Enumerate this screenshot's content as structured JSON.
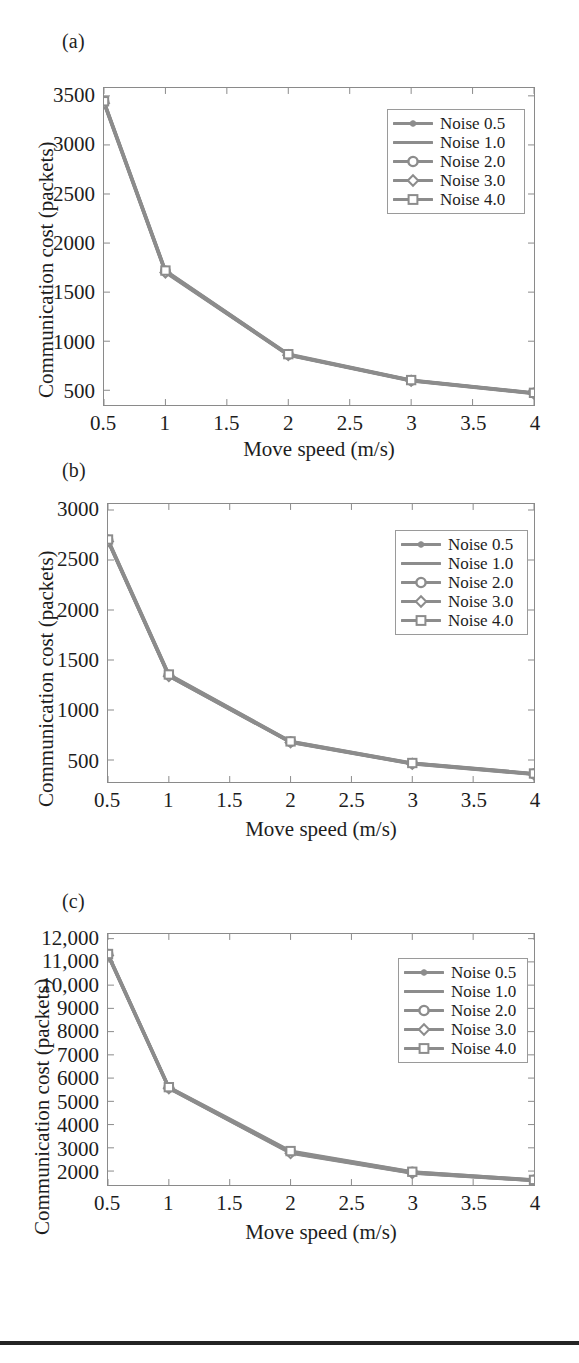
{
  "figure": {
    "background": "#ffffff",
    "line_color": "#8c8c8c",
    "frame_color": "#8a8a8a",
    "text_color": "#1d1d1d",
    "bottom_rule_color": "#242424"
  },
  "common": {
    "xlabel": "Move speed (m/s)",
    "ylabel": "Communication cost (packets)",
    "xticks": [
      "0.5",
      "1",
      "1.5",
      "2",
      "2.5",
      "3",
      "3.5",
      "4"
    ],
    "legend_labels": [
      "Noise 0.5",
      "Noise 1.0",
      "Noise 2.0",
      "Noise 3.0",
      "Noise 4.0"
    ],
    "legend_markers": [
      "dot",
      "none",
      "circle",
      "diamond",
      "square"
    ]
  },
  "panels": [
    {
      "label": "(a)",
      "yticks": [
        "500",
        "1000",
        "1500",
        "2000",
        "2500",
        "3000",
        "3500"
      ]
    },
    {
      "label": "(b)",
      "yticks": [
        "500",
        "1000",
        "1500",
        "2000",
        "2500",
        "3000"
      ]
    },
    {
      "label": "(c)",
      "yticks": [
        "2000",
        "3000",
        "4000",
        "5000",
        "6000",
        "7000",
        "8000",
        "9000",
        "10,000",
        "11,000",
        "12,000"
      ]
    }
  ],
  "chart_data": [
    {
      "type": "line",
      "panel": "(a)",
      "title": "(a)",
      "xlabel": "Move speed (m/s)",
      "ylabel": "Communication cost (packets)",
      "x": [
        0.5,
        1,
        2,
        3,
        4
      ],
      "xlim": [
        0.5,
        4
      ],
      "ylim": [
        350,
        3580
      ],
      "xticks": [
        0.5,
        1,
        1.5,
        2,
        2.5,
        3,
        3.5,
        4
      ],
      "yticks": [
        500,
        1000,
        1500,
        2000,
        2500,
        3000,
        3500
      ],
      "grid": false,
      "legend_position": "upper right",
      "series": [
        {
          "name": "Noise 0.5",
          "marker": "dot",
          "values": [
            3430,
            1710,
            860,
            600,
            470
          ]
        },
        {
          "name": "Noise 1.0",
          "marker": "none",
          "values": [
            3435,
            1705,
            862,
            598,
            468
          ]
        },
        {
          "name": "Noise 2.0",
          "marker": "circle",
          "values": [
            3440,
            1715,
            865,
            602,
            472
          ]
        },
        {
          "name": "Noise 3.0",
          "marker": "diamond",
          "values": [
            3425,
            1700,
            858,
            596,
            466
          ]
        },
        {
          "name": "Noise 4.0",
          "marker": "square",
          "values": [
            3445,
            1720,
            868,
            604,
            474
          ]
        }
      ]
    },
    {
      "type": "line",
      "panel": "(b)",
      "title": "(b)",
      "xlabel": "Move speed (m/s)",
      "ylabel": "Communication cost (packets)",
      "x": [
        0.5,
        1,
        2,
        3,
        4
      ],
      "xlim": [
        0.5,
        4
      ],
      "ylim": [
        280,
        3060
      ],
      "xticks": [
        0.5,
        1,
        1.5,
        2,
        2.5,
        3,
        3.5,
        4
      ],
      "yticks": [
        500,
        1000,
        1500,
        2000,
        2500,
        3000
      ],
      "grid": false,
      "legend_position": "upper right",
      "series": [
        {
          "name": "Noise 0.5",
          "marker": "dot",
          "values": [
            2690,
            1345,
            680,
            465,
            360
          ]
        },
        {
          "name": "Noise 1.0",
          "marker": "none",
          "values": [
            2695,
            1340,
            678,
            463,
            358
          ]
        },
        {
          "name": "Noise 2.0",
          "marker": "circle",
          "values": [
            2700,
            1350,
            684,
            468,
            362
          ]
        },
        {
          "name": "Noise 3.0",
          "marker": "diamond",
          "values": [
            2685,
            1338,
            676,
            461,
            356
          ]
        },
        {
          "name": "Noise 4.0",
          "marker": "square",
          "values": [
            2705,
            1355,
            686,
            470,
            365
          ]
        }
      ]
    },
    {
      "type": "line",
      "panel": "(c)",
      "title": "(c)",
      "xlabel": "Move speed (m/s)",
      "ylabel": "Communication cost (packets)",
      "x": [
        0.5,
        1,
        2,
        3,
        4
      ],
      "xlim": [
        0.5,
        4
      ],
      "ylim": [
        1400,
        12200
      ],
      "xticks": [
        0.5,
        1,
        1.5,
        2,
        2.5,
        3,
        3.5,
        4
      ],
      "yticks": [
        2000,
        3000,
        4000,
        5000,
        6000,
        7000,
        8000,
        9000,
        10000,
        11000,
        12000
      ],
      "grid": false,
      "legend_position": "upper right",
      "series": [
        {
          "name": "Noise 0.5",
          "marker": "dot",
          "values": [
            11300,
            5580,
            2800,
            1930,
            1600
          ]
        },
        {
          "name": "Noise 1.0",
          "marker": "none",
          "values": [
            11310,
            5570,
            2790,
            1920,
            1595
          ]
        },
        {
          "name": "Noise 2.0",
          "marker": "circle",
          "values": [
            11330,
            5600,
            2830,
            1960,
            1615
          ]
        },
        {
          "name": "Noise 3.0",
          "marker": "diamond",
          "values": [
            11280,
            5560,
            2770,
            1910,
            1590
          ]
        },
        {
          "name": "Noise 4.0",
          "marker": "square",
          "values": [
            11340,
            5610,
            2860,
            1970,
            1620
          ]
        }
      ]
    }
  ]
}
